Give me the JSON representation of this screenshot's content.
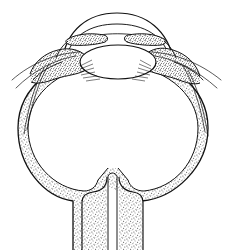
{
  "figure": {
    "title": "Cross-section of the human eye (sagittal schematic)",
    "domain": "anatomical line diagram",
    "caption": "",
    "visible_text": [],
    "canvas": {
      "width": 233,
      "height": 250,
      "background_color": "#ffffff"
    },
    "style": {
      "ink_color": "#111111",
      "stipple_dot_color": "#4a4a4a",
      "interior_fill": "#ffffff",
      "line_weight_outline": 1.1,
      "line_weight_hairline": 0.7,
      "technique": "pen-and-ink stipple shading on white"
    },
    "structures": [
      {
        "name": "sclera-wall",
        "label": "sclera",
        "shading": "stipple",
        "description": "thick stippled band forming the outer globe wall",
        "outer_radius_x": 94,
        "outer_radius_y": 73,
        "wall_thickness": 10,
        "center": {
          "x": 113,
          "y": 128
        }
      },
      {
        "name": "cornea",
        "label": "cornea",
        "shading": "outline-only",
        "description": "double-arc transparent dome at the top of the globe",
        "span_x": [
          62,
          174
        ],
        "outer_apex_y": 13,
        "inner_apex_y": 24
      },
      {
        "name": "anterior-chamber",
        "label": "anterior chamber",
        "shading": "clear",
        "description": "clear space between cornea and iris/lens"
      },
      {
        "name": "iris-left",
        "label": "iris (left leaf)",
        "shading": "stipple",
        "description": "stippled flap projecting inward from left ciliary body toward pupil"
      },
      {
        "name": "iris-right",
        "label": "iris (right leaf)",
        "shading": "stipple",
        "description": "stippled flap projecting inward from right ciliary body toward pupil"
      },
      {
        "name": "pupil-aperture",
        "label": "pupil",
        "shading": "clear",
        "description": "central gap between the two iris leaves",
        "span_x": [
          104,
          128
        ],
        "y": 34
      },
      {
        "name": "lens",
        "label": "lens",
        "shading": "outline-only",
        "description": "biconvex ellipse behind the iris",
        "center": {
          "x": 118,
          "y": 62
        },
        "radius_x": 38,
        "radius_y": 17
      },
      {
        "name": "ciliary-body-left",
        "label": "ciliary body (left)",
        "shading": "stipple",
        "description": "dense stippled wedge at the left limbus"
      },
      {
        "name": "ciliary-body-right",
        "label": "ciliary body (right)",
        "shading": "stipple",
        "description": "dense stippled wedge at the right limbus"
      },
      {
        "name": "zonule-fibers-left",
        "label": "zonular fibres (left)",
        "shading": "hairlines",
        "description": "fine radiating lines between ciliary body and lens equator"
      },
      {
        "name": "zonule-fibers-right",
        "label": "zonular fibres (right)",
        "shading": "hairlines",
        "description": "fine radiating lines between ciliary body and lens equator"
      },
      {
        "name": "vitreous-chamber",
        "label": "vitreous body",
        "shading": "clear",
        "description": "large clear interior of the globe"
      },
      {
        "name": "conjunctiva-left",
        "label": "conjunctiva / Tenon's capsule (left)",
        "shading": "hairlines",
        "description": "thin lines sweeping down-left away from the limbus"
      },
      {
        "name": "conjunctiva-right",
        "label": "conjunctiva / Tenon's capsule (right)",
        "shading": "hairlines",
        "description": "thin lines sweeping down-right away from the limbus"
      },
      {
        "name": "optic-nerve",
        "label": "optic nerve",
        "shading": "stipple",
        "description": "stippled stalk descending from the posterior pole to the lower edge",
        "span_x": [
          84,
          142
        ],
        "top_y": 188,
        "bottom_y": 250
      },
      {
        "name": "central-retinal-vessel",
        "label": "central retinal vessels",
        "shading": "line",
        "description": "narrow cleft line running down the middle of the optic nerve",
        "x": 110
      }
    ]
  }
}
